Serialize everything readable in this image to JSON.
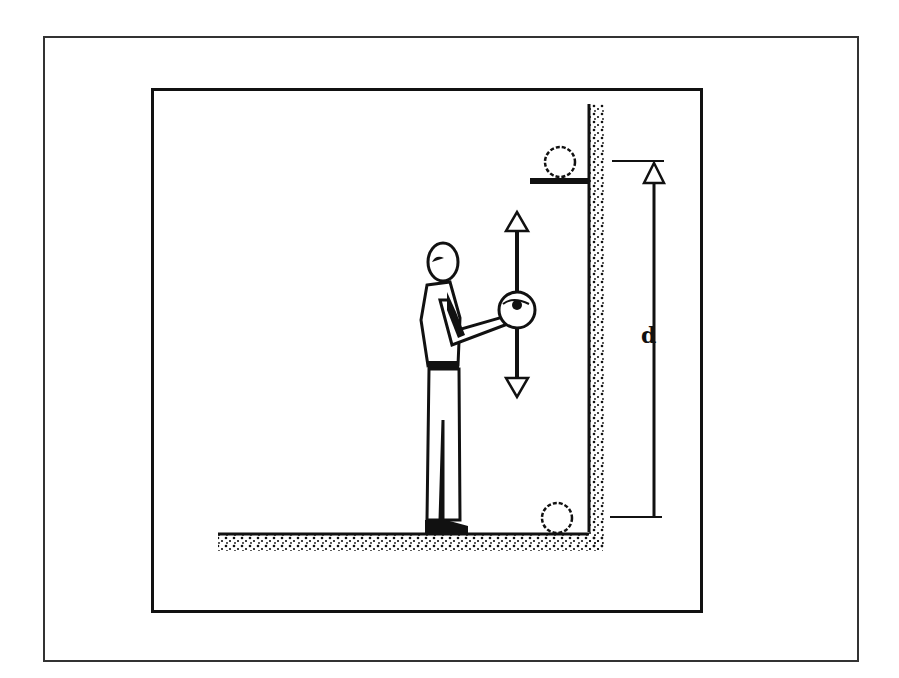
{
  "figure": {
    "type": "physics-illustration",
    "labels": {
      "height_label": "d"
    },
    "arrows": {
      "ball_motion": "vertical double-headed arrow (up and down)",
      "height_dimension": "dimension arrow from floor to shelf"
    },
    "objects": [
      "person",
      "ball-in-hands",
      "ball-on-shelf",
      "ball-on-floor",
      "shelf",
      "wall",
      "floor"
    ]
  }
}
